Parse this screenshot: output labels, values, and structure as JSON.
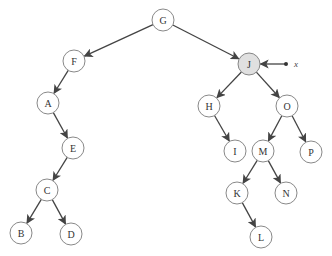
{
  "diagram": {
    "type": "binary-tree",
    "highlight_color": "#e0e0e0",
    "node_radius": 11,
    "nodes": [
      {
        "id": "G",
        "label": "G",
        "x": 163,
        "y": 20,
        "highlighted": false
      },
      {
        "id": "F",
        "label": "F",
        "x": 74,
        "y": 61,
        "highlighted": false
      },
      {
        "id": "J",
        "label": "J",
        "x": 249,
        "y": 64,
        "highlighted": true
      },
      {
        "id": "A",
        "label": "A",
        "x": 48,
        "y": 103,
        "highlighted": false
      },
      {
        "id": "E",
        "label": "E",
        "x": 73,
        "y": 148,
        "highlighted": false
      },
      {
        "id": "C",
        "label": "C",
        "x": 47,
        "y": 190,
        "highlighted": false
      },
      {
        "id": "B",
        "label": "B",
        "x": 21,
        "y": 233,
        "highlighted": false
      },
      {
        "id": "D",
        "label": "D",
        "x": 71,
        "y": 234,
        "highlighted": false
      },
      {
        "id": "H",
        "label": "H",
        "x": 209,
        "y": 106,
        "highlighted": false
      },
      {
        "id": "O",
        "label": "O",
        "x": 287,
        "y": 106,
        "highlighted": false
      },
      {
        "id": "I",
        "label": "I",
        "x": 235,
        "y": 151,
        "highlighted": false
      },
      {
        "id": "M",
        "label": "M",
        "x": 263,
        "y": 151,
        "highlighted": false
      },
      {
        "id": "P",
        "label": "P",
        "x": 311,
        "y": 152,
        "highlighted": false
      },
      {
        "id": "K",
        "label": "K",
        "x": 237,
        "y": 193,
        "highlighted": false
      },
      {
        "id": "N",
        "label": "N",
        "x": 286,
        "y": 193,
        "highlighted": false
      },
      {
        "id": "L",
        "label": "L",
        "x": 261,
        "y": 237,
        "highlighted": false
      }
    ],
    "edges": [
      {
        "from": "G",
        "to": "F"
      },
      {
        "from": "G",
        "to": "J"
      },
      {
        "from": "F",
        "to": "A"
      },
      {
        "from": "A",
        "to": "E"
      },
      {
        "from": "E",
        "to": "C"
      },
      {
        "from": "C",
        "to": "B"
      },
      {
        "from": "C",
        "to": "D"
      },
      {
        "from": "J",
        "to": "H"
      },
      {
        "from": "J",
        "to": "O"
      },
      {
        "from": "H",
        "to": "I"
      },
      {
        "from": "O",
        "to": "M"
      },
      {
        "from": "O",
        "to": "P"
      },
      {
        "from": "M",
        "to": "K"
      },
      {
        "from": "M",
        "to": "N"
      },
      {
        "from": "K",
        "to": "L"
      }
    ],
    "pointer": {
      "label": "x",
      "target": "J",
      "start_x": 286,
      "start_y": 64,
      "label_x": 294,
      "label_y": 64
    }
  }
}
